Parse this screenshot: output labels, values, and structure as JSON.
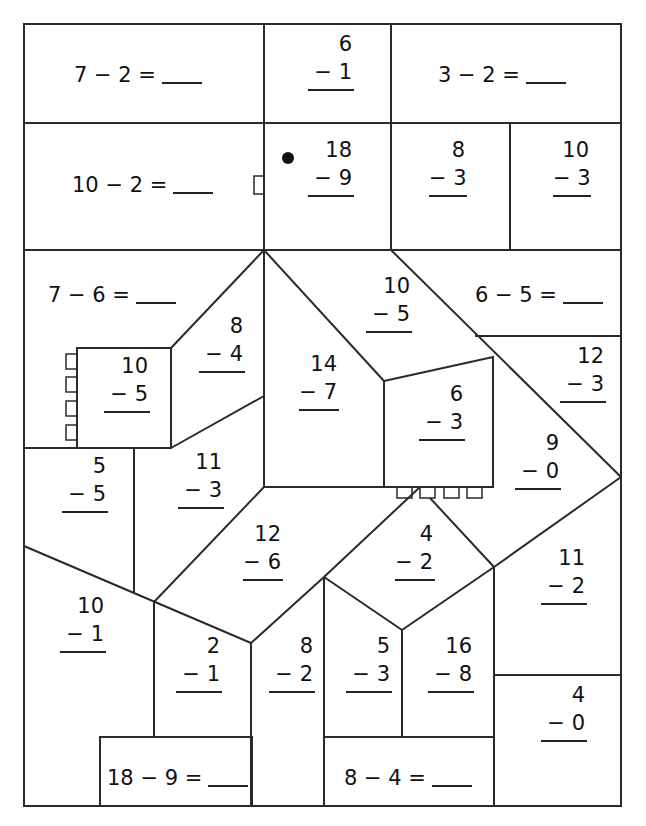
{
  "worksheet": {
    "horizontal_problems": [
      {
        "id": "h1",
        "text": "7 − 2 =",
        "x": 74,
        "y": 64
      },
      {
        "id": "h2",
        "text": "3 − 2 =",
        "x": 438,
        "y": 64
      },
      {
        "id": "h3",
        "text": "10 − 2 =",
        "x": 72,
        "y": 174
      },
      {
        "id": "h4",
        "text": "7 − 6 =",
        "x": 48,
        "y": 284
      },
      {
        "id": "h5",
        "text": "6 − 5 =",
        "x": 475,
        "y": 284
      },
      {
        "id": "h6",
        "text": "18 − 9 =",
        "x": 107,
        "y": 767
      },
      {
        "id": "h7",
        "text": "8 − 4 =",
        "x": 344,
        "y": 767
      }
    ],
    "vertical_problems": [
      {
        "id": "v1",
        "top": "6",
        "bottom": "− 1",
        "x": 308,
        "y": 34,
        "w": 46
      },
      {
        "id": "v2",
        "top": "18",
        "bottom": "− 9",
        "x": 308,
        "y": 140,
        "w": 46
      },
      {
        "id": "v3",
        "top": "8",
        "bottom": "− 3",
        "x": 429,
        "y": 140,
        "w": 38
      },
      {
        "id": "v4",
        "top": "10",
        "bottom": "− 3",
        "x": 553,
        "y": 140,
        "w": 38
      },
      {
        "id": "v5",
        "top": "10",
        "bottom": "− 5",
        "x": 366,
        "y": 276,
        "w": 46
      },
      {
        "id": "v6",
        "top": "8",
        "bottom": "− 4",
        "x": 199,
        "y": 316,
        "w": 46
      },
      {
        "id": "v7",
        "top": "12",
        "bottom": "− 3",
        "x": 560,
        "y": 346,
        "w": 46
      },
      {
        "id": "v8",
        "top": "10",
        "bottom": "− 5",
        "x": 104,
        "y": 356,
        "w": 46
      },
      {
        "id": "v9",
        "top": "14",
        "bottom": "− 7",
        "x": 299,
        "y": 354,
        "w": 40
      },
      {
        "id": "v10",
        "top": "6",
        "bottom": "− 3",
        "x": 419,
        "y": 384,
        "w": 46
      },
      {
        "id": "v11",
        "top": "9",
        "bottom": "− 0",
        "x": 515,
        "y": 433,
        "w": 46
      },
      {
        "id": "v12",
        "top": "5",
        "bottom": "− 5",
        "x": 62,
        "y": 456,
        "w": 46
      },
      {
        "id": "v13",
        "top": "11",
        "bottom": "− 3",
        "x": 178,
        "y": 452,
        "w": 46
      },
      {
        "id": "v14",
        "top": "12",
        "bottom": "− 6",
        "x": 243,
        "y": 524,
        "w": 40
      },
      {
        "id": "v15",
        "top": "4",
        "bottom": "− 2",
        "x": 395,
        "y": 524,
        "w": 40
      },
      {
        "id": "v16",
        "top": "11",
        "bottom": "− 2",
        "x": 541,
        "y": 548,
        "w": 46
      },
      {
        "id": "v17",
        "top": "10",
        "bottom": "− 1",
        "x": 60,
        "y": 596,
        "w": 46
      },
      {
        "id": "v18",
        "top": "2",
        "bottom": "− 1",
        "x": 176,
        "y": 636,
        "w": 46
      },
      {
        "id": "v19",
        "top": "8",
        "bottom": "− 2",
        "x": 269,
        "y": 636,
        "w": 46
      },
      {
        "id": "v20",
        "top": "5",
        "bottom": "− 3",
        "x": 346,
        "y": 636,
        "w": 46
      },
      {
        "id": "v21",
        "top": "16",
        "bottom": "− 8",
        "x": 428,
        "y": 636,
        "w": 46
      },
      {
        "id": "v22",
        "top": "4",
        "bottom": "− 0",
        "x": 541,
        "y": 685,
        "w": 46
      }
    ]
  }
}
